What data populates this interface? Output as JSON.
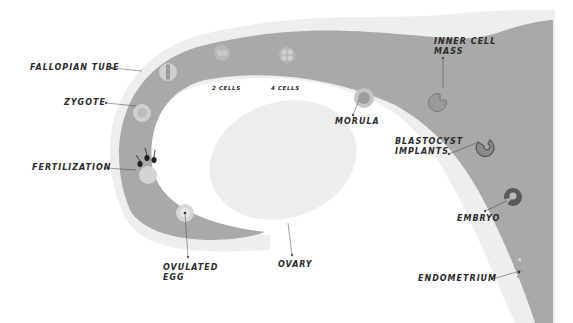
{
  "diagram": {
    "colors": {
      "tube": "#a9a9a9",
      "tube_halo": "#ececec",
      "ovary": "#ededed",
      "cell_light": "#d4d4d4",
      "cell_dark": "#5e5e5e",
      "embryo": "#6a6a6a",
      "text": "#2b2b2b",
      "sperm": "#1e1e1e"
    },
    "labels": {
      "fallopian_tube": "FALLOPIAN TUBE",
      "zygote": "ZYGOTE",
      "fertilization": "FERTILIZATION",
      "ovulated_egg_line1": "OVULATED",
      "ovulated_egg_line2": "EGG",
      "ovary": "OVARY",
      "two_cells": "2 CELLS",
      "four_cells": "4 CELLS",
      "morula": "MORULA",
      "inner_cell_mass_line1": "INNER CELL",
      "inner_cell_mass_line2": "MASS",
      "blastocyst_line1": "BLASTOCYST",
      "blastocyst_line2": "IMPLANTS",
      "embryo": "EMBRYO",
      "endometrium": "ENDOMETRIUM"
    }
  }
}
